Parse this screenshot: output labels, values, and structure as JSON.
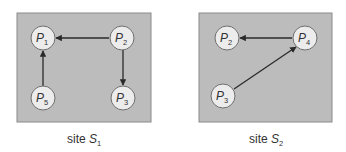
{
  "sites": [
    {
      "caption": {
        "prefix": "site ",
        "symbol": "S",
        "subscript": "1"
      },
      "nodes": [
        {
          "id": "P1",
          "symbol": "P",
          "subscript": "1"
        },
        {
          "id": "P2",
          "symbol": "P",
          "subscript": "2"
        },
        {
          "id": "P5",
          "symbol": "P",
          "subscript": "5"
        },
        {
          "id": "P3",
          "symbol": "P",
          "subscript": "3"
        }
      ],
      "edges": [
        {
          "from": "P2",
          "to": "P1"
        },
        {
          "from": "P2",
          "to": "P3"
        },
        {
          "from": "P5",
          "to": "P1"
        }
      ]
    },
    {
      "caption": {
        "prefix": "site ",
        "symbol": "S",
        "subscript": "2"
      },
      "nodes": [
        {
          "id": "P2",
          "symbol": "P",
          "subscript": "2"
        },
        {
          "id": "P4",
          "symbol": "P",
          "subscript": "4"
        },
        {
          "id": "P3",
          "symbol": "P",
          "subscript": "3"
        }
      ],
      "edges": [
        {
          "from": "P4",
          "to": "P2"
        },
        {
          "from": "P3",
          "to": "P4"
        }
      ]
    }
  ],
  "colors": {
    "box_fill": "#bcbcbc",
    "node_fill": "#ececec",
    "edge": "#2a2a2a"
  }
}
